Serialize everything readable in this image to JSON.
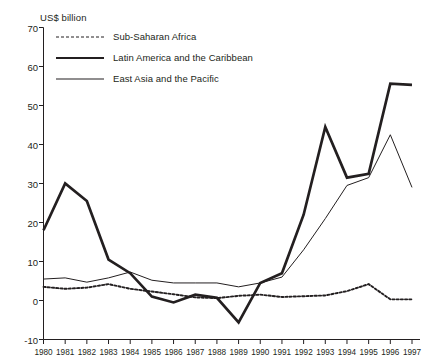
{
  "chart_data": {
    "type": "line",
    "title": "",
    "ylabel": "US$ billion",
    "xlabel": "",
    "ylim": [
      -10,
      70
    ],
    "xlim": [
      1980,
      1997
    ],
    "grid": false,
    "legend_position": "top-left",
    "ytick_labels": [
      "70",
      "60",
      "50",
      "40",
      "30",
      "20",
      "10",
      "0",
      "-10"
    ],
    "ytick_values": [
      70,
      60,
      50,
      40,
      30,
      20,
      10,
      0,
      -10
    ],
    "categories": [
      "1980",
      "1981",
      "1982",
      "1983",
      "1984",
      "1985",
      "1986",
      "1987",
      "1988",
      "1989",
      "1990",
      "1991",
      "1992",
      "1993",
      "1994",
      "1995",
      "1996",
      "1997"
    ],
    "x": [
      1980,
      1981,
      1982,
      1983,
      1984,
      1985,
      1986,
      1987,
      1988,
      1989,
      1990,
      1991,
      1992,
      1993,
      1994,
      1995,
      1996,
      1997
    ],
    "series": [
      {
        "name": "Sub-Saharan Africa",
        "style": "dotted",
        "values": [
          3.5,
          3.0,
          3.3,
          4.2,
          3.0,
          2.3,
          1.6,
          0.8,
          0.6,
          1.2,
          1.5,
          0.9,
          1.1,
          1.3,
          2.4,
          4.2,
          0.3,
          0.3
        ]
      },
      {
        "name": "Latin America and the Caribbean",
        "style": "thick",
        "values": [
          18.0,
          30.0,
          25.5,
          10.5,
          7.0,
          1.0,
          -0.5,
          1.5,
          0.7,
          -5.6,
          4.5,
          7.0,
          22.0,
          44.5,
          31.5,
          32.5,
          55.6,
          55.3
        ]
      },
      {
        "name": "East Asia and the Pacific",
        "style": "thin",
        "values": [
          5.5,
          5.8,
          4.7,
          5.8,
          7.3,
          5.2,
          4.5,
          4.5,
          4.5,
          3.5,
          4.5,
          6.0,
          13.0,
          21.0,
          29.5,
          31.5,
          42.5,
          29.0
        ]
      }
    ]
  },
  "legend": {
    "items": [
      {
        "label": "Sub-Saharan Africa",
        "style": "dotted"
      },
      {
        "label": "Latin America and the Caribbean",
        "style": "thick"
      },
      {
        "label": "East Asia and the Pacific",
        "style": "thin"
      }
    ]
  },
  "axes": {
    "unit_label": "US$ billion"
  }
}
